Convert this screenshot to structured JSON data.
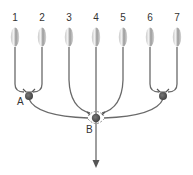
{
  "diagram": {
    "type": "convergent-pathway",
    "elements": [
      {
        "id": "1",
        "label": "1"
      },
      {
        "id": "2",
        "label": "2"
      },
      {
        "id": "3",
        "label": "3"
      },
      {
        "id": "4",
        "label": "4"
      },
      {
        "id": "5",
        "label": "5"
      },
      {
        "id": "6",
        "label": "6"
      },
      {
        "id": "7",
        "label": "7"
      }
    ],
    "nodes": [
      {
        "id": "A",
        "label": "A",
        "inputs": [
          "1",
          "2"
        ]
      },
      {
        "id": "B",
        "label": "B",
        "inputs": [
          "A",
          "3",
          "4",
          "5",
          "C"
        ]
      },
      {
        "id": "C",
        "label": "",
        "inputs": [
          "6",
          "7"
        ]
      }
    ],
    "output": {
      "from": "B",
      "direction": "down",
      "icon": "arrow-down-icon"
    },
    "colors": {
      "line": "#6a6a6a",
      "node": "#555555",
      "text": "#333333"
    }
  }
}
